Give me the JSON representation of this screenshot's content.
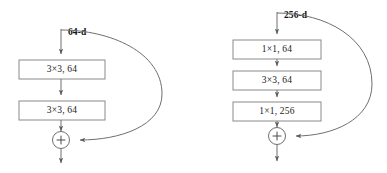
{
  "figure": {
    "caption": "",
    "colors": {
      "stroke": "#6f6f6f",
      "box_stroke": "#8a8a8a",
      "text": "#1a1a1a",
      "background": "#ffffff"
    }
  },
  "blocks": [
    {
      "id": "basic-block",
      "name": "basic-residual-block",
      "input_label": "64-d",
      "layers": [
        {
          "label": "3×3, 64"
        },
        {
          "label": "3×3, 64"
        }
      ],
      "sum_symbol": "+",
      "has_skip_connection": true
    },
    {
      "id": "bottleneck-block",
      "name": "bottleneck-residual-block",
      "input_label": "256-d",
      "layers": [
        {
          "label": "1×1, 64"
        },
        {
          "label": "3×3, 64"
        },
        {
          "label": "1×1, 256"
        }
      ],
      "sum_symbol": "+",
      "has_skip_connection": true
    }
  ]
}
